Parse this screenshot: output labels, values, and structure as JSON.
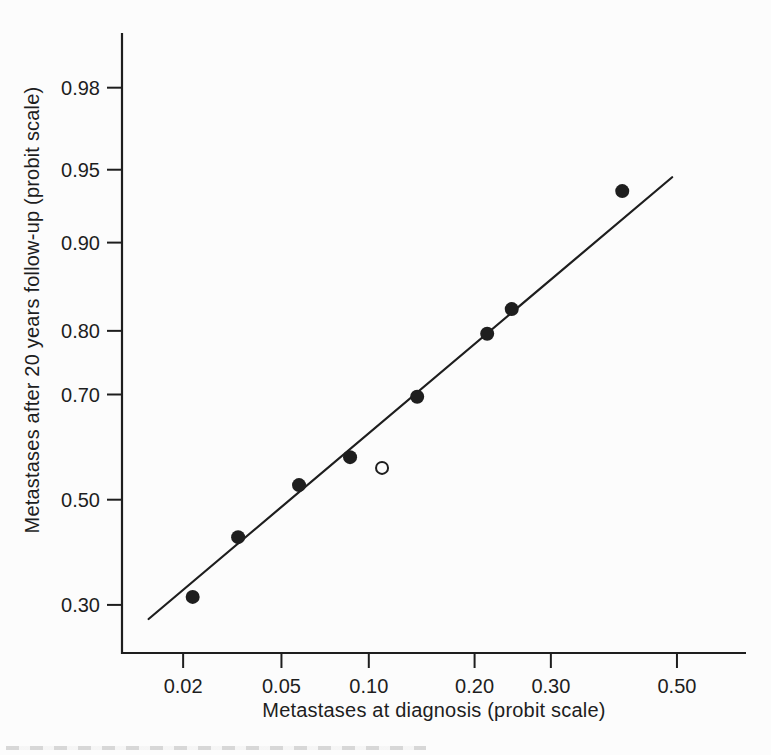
{
  "figure": {
    "background": "#fcfcfc",
    "ink": "#1e1e1e"
  },
  "chart_data": {
    "type": "scatter",
    "title": "",
    "xlabel": "Metastases at diagnosis (probit scale)",
    "ylabel": "Metastases after 20 years follow-up (probit scale)",
    "x_scale": "probit",
    "y_scale": "probit",
    "xlim": [
      0.0105,
      0.613
    ],
    "ylim": [
      0.2224,
      0.99
    ],
    "grid": false,
    "legend": "none",
    "x_ticks": {
      "values": [
        0.02,
        0.05,
        0.1,
        0.2,
        0.3,
        0.5
      ],
      "labels": [
        "0.02",
        "0.05",
        "0.10",
        "0.20",
        "0.30",
        "0.50"
      ]
    },
    "y_ticks": {
      "values": [
        0.98,
        0.95,
        0.9,
        0.8,
        0.7,
        0.5,
        0.3
      ],
      "labels": [
        "0.98",
        "0.95",
        "0.90",
        "0.80",
        "0.70",
        "0.50",
        "0.30"
      ]
    },
    "series": [
      {
        "name": "observed proportions",
        "marker": "filled-circle",
        "color": "#1e1e1e",
        "points": [
          [
            0.022,
            0.314
          ],
          [
            0.034,
            0.426
          ],
          [
            0.058,
            0.529
          ],
          [
            0.087,
            0.584
          ],
          [
            0.14,
            0.696
          ],
          [
            0.215,
            0.796
          ],
          [
            0.246,
            0.829
          ],
          [
            0.41,
            0.938
          ]
        ]
      },
      {
        "name": "outlier point",
        "marker": "open-circle",
        "color": "#1e1e1e",
        "points": [
          [
            0.11,
            0.563
          ]
        ]
      }
    ],
    "fit_line": {
      "x1": 0.014,
      "y1": 0.276,
      "x2": 0.492,
      "y2": 0.946
    }
  }
}
